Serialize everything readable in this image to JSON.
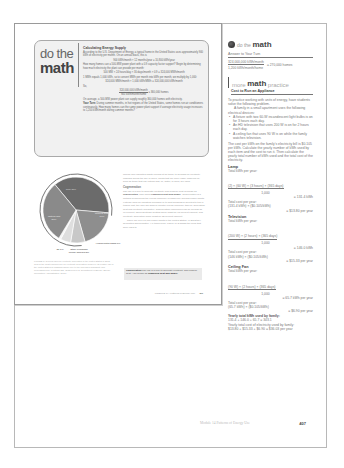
{
  "inset_page": {
    "do_the_math": {
      "title_line1": "do the",
      "title_line2": "math",
      "heading": "Calculating Energy Supply",
      "intro": "According to the U.S. Department of Energy, a typical home in the United States uses approximately 900 kWh of electricity per month. On an annual basis, this is",
      "eq1": "900 kWh/month × 12 months/year = 10,800 kWh/year",
      "question": "How many homes can a 500-MW power plant with a 0.9 capacity factor support? Begin by determining how much electricity the plant can provide per month:",
      "eq2": "500 MW × 24 hours/day × 30 days/month × 0.9 = 324,000 MWh/month",
      "note": "1 MWh equals 1,000 kWh, so to convert MWh per month into kWh per month, we multiply by 1,000:",
      "eq3": "324,000 MWh/month × 1,000 kWh/MWh = 324,000,000 kWh/month",
      "so": "So,",
      "frac_num": "324,000,000 kWh/month",
      "frac_den": "900 kWh/month/home",
      "frac_res": "= 360,000 homes",
      "conclusion": "On average, a 500-MW power plant can supply roughly 360,000 homes with electricity.",
      "your_turn_label": "Your Turn:",
      "your_turn": "During summer months, in hot regions of the United States, some homes run air conditioners continuously. How many homes can the same power plant support if average electricity usage increases to 1,200 kWh/month during summer months?"
    },
    "body_text": {
      "para1": "include well-insulated plants running at all times, to demand for electricity changes during the day or week, plants that are more easily powered up, such as those that use natural gas, oil, water, or wind, are used.",
      "subhead": "Cogeneration",
      "para2_start": "The use of a fuel to generate electricity and produce heat is known as ",
      "para2_bold": "cogeneration",
      "para2_mid": ", also called ",
      "para2_bold2": "combined heat and power",
      "para2_end": ". Cogeneration is a method of improving the overall efficiency of fossil-fuel–burning power plants. If steam used for industrial purposes or to heat buildings is diverted to turn a turbine first, the user will achieve greater overall efficiency than by generating heat and electricity separately. Cogeneration efficiencies can be as high as 90 percent, whereas steam heating alone might be 75 percent efficient, and electricity generation alone might be 35 percent efficient.",
      "para3": "There are over 17,000 power plants in the United States. In 2012 they generated approximately 4.1 trillion kWh. Figure 14.2 shows the fuels that were used to"
    },
    "figure_caption": "FIGURE 14.2 Fuels used for electricity generation in the United States in 2012. Coal is the most common fuel for electricity generation; however, its relative use in the United States is changing rapidly due to the increased availability and decreasing price of natural gas. (Data from U.S. Department of Energy, Energy Information Administration, 2013.)",
    "glossary": {
      "term": "Cogeneration",
      "definition": " The use of a fuel to generate electricity and produce heat. Also known as ",
      "bold_end": "combined heat and power."
    },
    "footer": {
      "module": "MODULE 14  |  Patterns of Energy Use",
      "page": "407"
    }
  },
  "chart_data": {
    "type": "pie",
    "categories": [
      "Coal",
      "Nuclear fuels",
      "Hydroelectric dams",
      "Other renewable energy sources",
      "Oil",
      "Natural gas"
    ],
    "values": [
      37,
      19,
      7,
      5,
      1,
      30
    ],
    "labels": [
      "Coal 37%",
      "Nuclear fuels 19%",
      "Hydroelectric dams 7%",
      "Other renewable energy sources 5%",
      "Oil 1%",
      "Natural gas 30%"
    ],
    "arc_label": "Fossil fuels",
    "colors": [
      "#6b6b6b",
      "#8e8e8e",
      "#c8c8c8",
      "#dedede",
      "#f4f4f4",
      "#8a8a8a"
    ]
  },
  "right_column": {
    "header": {
      "light": "do the",
      "bold": "math"
    },
    "answer_heading": "Answer to Your Turn",
    "answer_num": "324,000,000 kWh/month",
    "answer_den": "1,200 kWh/month/home",
    "answer_res": "= 270,000 homes",
    "mmp": {
      "light1": "more",
      "bold": "math",
      "light2": "practice"
    },
    "mmp_title": "Cost to Run an Appliance",
    "intro": "To practice working with units of energy, have students solve the following problem.",
    "problem": "A family in a small apartment uses the following electrical devices:",
    "devices": [
      "A fixture with two 60-W incandescent light bulbs is on for 3 hours each day.",
      "An HD television that uses 200 W is on for 2 hours each day.",
      "A ceiling fan that uses 90 W is on while the family watches television."
    ],
    "task": "The cost per kWh on the family's electricity bill is $0.105 per kWh. Calculate the yearly number of kWh used by each item and the cost to run it. Then calculate the yearly total number of kWh used and the total cost of the electricity.",
    "sections": [
      {
        "name": "Lamp",
        "kwh_label": "Total kWh per year:",
        "kwh_num": "(2) × (60 W) × (3 hours) × (365 days)",
        "kwh_den": "1,000",
        "kwh_res": "= 131.4 kWh",
        "cost_label": "Total cost per year:",
        "cost_eq": "(131.4 kWh) × ($0.105/kWh)",
        "cost_res": "= $13.80 per year"
      },
      {
        "name": "Television",
        "kwh_label": "Total kWh per year:",
        "kwh_num": "(200 W) × (2 hours) × (365 days)",
        "kwh_den": "1,000",
        "kwh_res": "= 146.0 kWh",
        "cost_label": "Total cost per year:",
        "cost_eq": "(146 kWh) × ($0.105/kWh)",
        "cost_res": "= $15.33 per year"
      },
      {
        "name": "Ceiling Fan",
        "kwh_label": "Total kWh per year:",
        "kwh_num": "(90 W) × (2 hours) × (365 days)",
        "kwh_den": "1,000",
        "kwh_res": "= 65.7 kWh per year",
        "cost_label": "Total cost per year:",
        "cost_eq": "(65.7 kWh) × ($0.105/kWh)",
        "cost_res": "= $6.90 per year"
      }
    ],
    "total_kwh_label": "Yearly total kWh used by family:",
    "total_kwh_eq": "131.4 + 146.0 + 65.7 = 343.1",
    "total_cost_label": "Yearly total cost of electricity used by family:",
    "total_cost_eq": "$13.80 + $15.33 + $6.90 = $36.03 per year"
  },
  "outer_footer": {
    "module": "Module 14   Patterns of Energy Use",
    "page": "407"
  }
}
